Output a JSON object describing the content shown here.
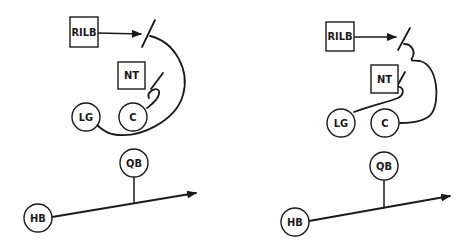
{
  "diagrams": [
    {
      "id": "left",
      "players": {
        "rilb": "RILB",
        "nt": "NT",
        "lg": "LG",
        "c": "C",
        "qb": "QB",
        "hb": "HB"
      }
    },
    {
      "id": "right",
      "players": {
        "rilb": "RILB",
        "nt": "NT",
        "lg": "LG",
        "c": "C",
        "qb": "QB",
        "hb": "HB"
      }
    }
  ],
  "colors": {
    "ink": "#1a1a1a",
    "background": "#ffffff"
  }
}
